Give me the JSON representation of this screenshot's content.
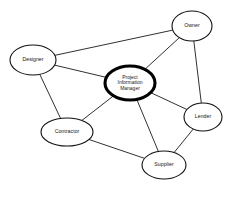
{
  "diagram": {
    "type": "node-link-network",
    "background_color": "#ffffff",
    "node_fill_color": "#ffffff",
    "node_stroke_color": "#111111",
    "edge_color": "#1a1a1a",
    "central_node_stroke_color": "#000000",
    "nodes": [
      {
        "id": "owner",
        "label": "Owner",
        "lines": [
          "Owner"
        ],
        "cx": 192,
        "cy": 26,
        "rx": 20,
        "ry": 15,
        "central": false
      },
      {
        "id": "designer",
        "label": "Designer",
        "lines": [
          "Designer"
        ],
        "cx": 33,
        "cy": 60,
        "rx": 23,
        "ry": 15,
        "central": false
      },
      {
        "id": "project-information-manager",
        "label": "Project Information Manager",
        "lines": [
          "Project",
          "Information",
          "Manager"
        ],
        "cx": 130,
        "cy": 83,
        "rx": 25,
        "ry": 17,
        "central": true
      },
      {
        "id": "lender",
        "label": "Lender",
        "lines": [
          "Lender"
        ],
        "cx": 203,
        "cy": 117,
        "rx": 19,
        "ry": 14,
        "central": false
      },
      {
        "id": "contractor",
        "label": "Contractor",
        "lines": [
          "Contractor"
        ],
        "cx": 67,
        "cy": 132,
        "rx": 26,
        "ry": 14,
        "central": false
      },
      {
        "id": "supplier",
        "label": "Supplier",
        "lines": [
          "Supplier"
        ],
        "cx": 164,
        "cy": 165,
        "rx": 22,
        "ry": 14,
        "central": false
      }
    ],
    "edges": [
      {
        "from": "designer",
        "to": "owner"
      },
      {
        "from": "designer",
        "to": "project-information-manager"
      },
      {
        "from": "designer",
        "to": "contractor"
      },
      {
        "from": "owner",
        "to": "project-information-manager"
      },
      {
        "from": "owner",
        "to": "lender"
      },
      {
        "from": "project-information-manager",
        "to": "contractor"
      },
      {
        "from": "project-information-manager",
        "to": "supplier"
      },
      {
        "from": "project-information-manager",
        "to": "lender"
      },
      {
        "from": "contractor",
        "to": "supplier"
      },
      {
        "from": "supplier",
        "to": "lender"
      }
    ]
  }
}
